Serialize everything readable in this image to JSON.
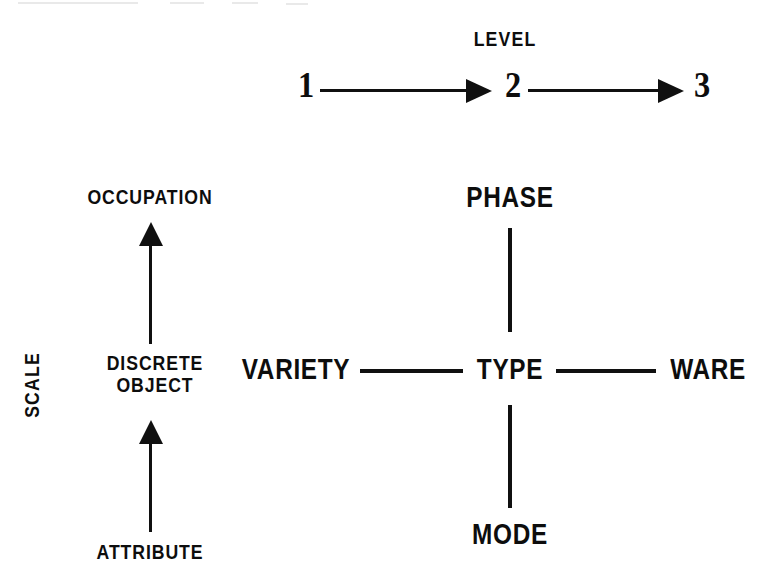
{
  "figure": {
    "background_color": "#ffffff",
    "ink_color": "#101010"
  },
  "level_axis": {
    "title": "LEVEL",
    "steps": [
      "1",
      "2",
      "3"
    ],
    "arrows": [
      "1-to-2",
      "2-to-3"
    ],
    "direction": "left-to-right"
  },
  "scale_axis": {
    "title": "SCALE",
    "steps": [
      "ATTRIBUTE",
      "DISCRETE OBJECT",
      "OCCUPATION"
    ],
    "step_line_1": "DISCRETE",
    "step_line_2": "OBJECT",
    "arrows": [
      "attribute-to-discrete-object",
      "discrete-object-to-occupation"
    ],
    "direction": "bottom-to-top"
  },
  "cross": {
    "center": "TYPE",
    "top": "PHASE",
    "bottom": "MODE",
    "left": "VARIETY",
    "right": "WARE"
  }
}
